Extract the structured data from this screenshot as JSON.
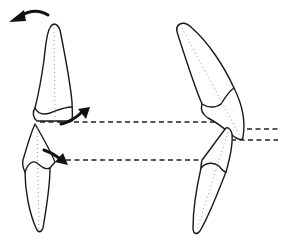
{
  "diagram": {
    "colors": {
      "outline": "#1a1a1a",
      "axis": "#9a9a9a",
      "reference_line": "#222222",
      "arrow": "#111111",
      "background": "#ffffff"
    },
    "elements": {
      "left_upper_incisor": "upright upper incisor",
      "left_lower_incisor": "upright lower incisor",
      "right_upper_incisor": "proclined upper incisor",
      "right_lower_incisor": "proclined lower incisor",
      "rotation_arrow": "counter-clockwise curved arrow at top left",
      "upper_edge_arrow": "arrow pointing up-right from upper incisal edge",
      "lower_edge_arrow": "arrow pointing down-right from lower incisal edge",
      "reference_lines": [
        "upper incisal edge level",
        "lower incisal edge level",
        "right upper incisal level",
        "right lower incisal level"
      ]
    }
  }
}
